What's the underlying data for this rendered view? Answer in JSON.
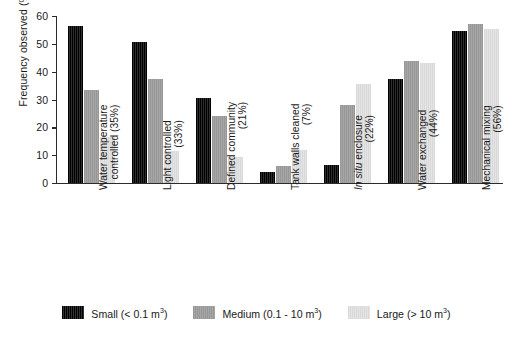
{
  "chart_data": {
    "type": "bar",
    "title": "",
    "xlabel": "",
    "ylabel": "Frequency observed (%)",
    "ylim": [
      0,
      60
    ],
    "yticks": [
      0,
      10,
      20,
      30,
      40,
      50,
      60
    ],
    "grid": false,
    "legend_position": "bottom-center",
    "categories": [
      "Water temperature controlled (35%)",
      "Light controlled (33%)",
      "Defined community (21%)",
      "Tank walls cleaned (7%)",
      "In situ enclosure (22%)",
      "Water exchanged (44%)",
      "Mechanical mixing (56%)"
    ],
    "category_lines": [
      [
        "Water temperature",
        "controlled (35%)"
      ],
      [
        "Light controlled",
        "(33%)"
      ],
      [
        "Defined community",
        "(21%)"
      ],
      [
        "Tank walls cleaned",
        "(7%)"
      ],
      [
        "In situ enclosure",
        "(22%)"
      ],
      [
        "Water exchanged",
        "(44%)"
      ],
      [
        "Mechanical mixing",
        "(56%)"
      ]
    ],
    "series": [
      {
        "name": "Small (< 0.1 m3)",
        "label_main": "Small (< 0.1 m",
        "label_sup": "3",
        "label_tail": ")",
        "color": "#161616",
        "values": [
          56.5,
          50.5,
          30.5,
          4.0,
          6.5,
          37.5,
          54.5
        ]
      },
      {
        "name": "Medium (0.1 - 10 m3)",
        "label_main": "Medium (0.1 - 10 m",
        "label_sup": "3",
        "label_tail": ")",
        "color": "#9d9d9d",
        "values": [
          33.5,
          37.5,
          24.0,
          6.0,
          28.0,
          44.0,
          57.0
        ]
      },
      {
        "name": "Large (> 10 m3)",
        "label_main": "Large (> 10 m",
        "label_sup": "3",
        "label_tail": ")",
        "color": "#dedede",
        "values": [
          16.5,
          11.5,
          9.5,
          12.0,
          35.5,
          43.0,
          55.5
        ]
      }
    ]
  },
  "caption": {
    "text": ""
  }
}
